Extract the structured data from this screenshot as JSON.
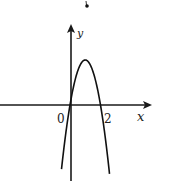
{
  "figure": {
    "type": "function-graph",
    "axes": {
      "x_label": "x",
      "y_label": "y",
      "origin_label": "0",
      "x_tick_labels": [
        "2"
      ]
    },
    "curve": {
      "kind": "parabola",
      "opens": "down",
      "roots_approx": [
        0,
        1.6
      ],
      "vertex_approx": {
        "x": 0.8,
        "y": 2.4
      }
    },
    "marks": [
      "dot above graph"
    ],
    "colors": {
      "line": "#1a1a1a",
      "background": "#ffffff"
    }
  }
}
